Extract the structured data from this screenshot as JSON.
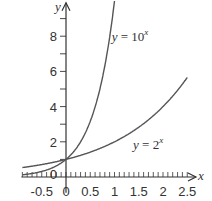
{
  "chart_data": {
    "type": "line",
    "title": "",
    "xlabel": "x",
    "ylabel": "y",
    "xlim": [
      -0.9,
      2.7
    ],
    "ylim": [
      -0.8,
      9.9
    ],
    "grid": false,
    "x_ticks": [
      "-0.5",
      "0",
      "0.5",
      "1",
      "1.5",
      "2",
      "2.5"
    ],
    "y_ticks": [
      "2",
      "4",
      "6",
      "8"
    ],
    "origin_label": "0",
    "series": [
      {
        "name": "y = 10^x",
        "label_base": "y = 10",
        "label_exp": "x",
        "function": "10^x",
        "x": [
          -0.9,
          -0.5,
          0,
          0.5,
          0.75,
          0.9,
          0.98
        ],
        "values": [
          0.13,
          0.32,
          1,
          3.16,
          5.62,
          7.94,
          9.55
        ]
      },
      {
        "name": "y = 2^x",
        "label_base": "y = 2",
        "label_exp": "x",
        "function": "2^x",
        "x": [
          -0.9,
          -0.5,
          0,
          0.5,
          1,
          1.5,
          2,
          2.5
        ],
        "values": [
          0.54,
          0.71,
          1,
          1.41,
          2,
          2.83,
          4,
          5.66
        ]
      }
    ],
    "colors": {
      "axis": "#333333",
      "curve": "#555555",
      "text": "#333333"
    }
  }
}
